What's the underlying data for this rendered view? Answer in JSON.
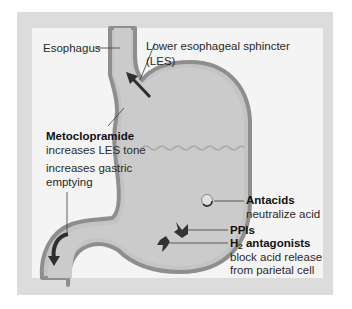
{
  "figure": {
    "colors": {
      "frame": "#dcdcdc",
      "panel": "#f4f4f4",
      "organ_fill": "#c4c4c4",
      "organ_wall": "#8e8e8e",
      "arrow": "#2e2e2e",
      "leader_line": "#3a3a3a"
    }
  },
  "labels": {
    "esophagus": "Esophagus",
    "les_line1": "Lower esophageal sphincter",
    "les_line2": "(LES)",
    "metoclopramide": {
      "name": "Metoclopramide",
      "effect1": "increases LES tone",
      "effect2_line1": "increases gastric",
      "effect2_line2": "emptying"
    },
    "antacids": {
      "name": "Antacids",
      "effect": "neutralize acid"
    },
    "ppis": {
      "name": "PPIs"
    },
    "h2": {
      "name_prefix": "H",
      "name_sub": "2",
      "name_suffix": " antagonists",
      "effect_line1": "block acid release",
      "effect_line2": "from parietal cell"
    }
  },
  "icons": {
    "antacid_symbol": "circle-swirl-icon",
    "ppi_symbol": "receptor-block-icon",
    "h2_symbol": "receptor-block-icon",
    "les_arrow": "arrow-up-icon",
    "emptying_arrow": "curved-arrow-down-icon"
  }
}
